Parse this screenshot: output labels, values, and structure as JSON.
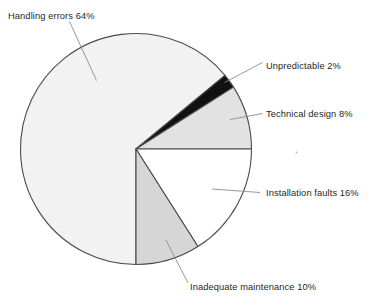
{
  "chart_data": {
    "type": "pie",
    "title": "",
    "subtitle": "",
    "xlabel": "",
    "ylabel": "",
    "legend_position": "none",
    "grid": false,
    "units": "percent",
    "total": 100,
    "categories": [
      "Handling errors",
      "Unpredictable",
      "Technical design",
      "Installation faults",
      "Inadequate maintenance"
    ],
    "values": [
      64,
      2,
      8,
      16,
      10
    ],
    "slices": [
      {
        "name": "handling-errors",
        "label": "Handling errors 64%",
        "category": "Handling errors",
        "value": 64,
        "color": "#f2f2f2",
        "start_angle_deg": 90,
        "end_angle_deg": 320.4
      },
      {
        "name": "unpredictable",
        "label": "Unpredictable 2%",
        "category": "Unpredictable",
        "value": 2,
        "color": "#111111",
        "start_angle_deg": 320.4,
        "end_angle_deg": 327.6
      },
      {
        "name": "technical-design",
        "label": "Technical design 8%",
        "category": "Technical design",
        "value": 8,
        "color": "#e2e2e2",
        "start_angle_deg": 327.6,
        "end_angle_deg": 360
      },
      {
        "name": "installation-faults",
        "label": "Installation faults 16%",
        "category": "Installation faults",
        "value": 16,
        "color": "#ffffff",
        "start_angle_deg": 0,
        "end_angle_deg": 57.6
      },
      {
        "name": "inadequate-maintenance",
        "label": "Inadequate maintenance 10%",
        "category": "Inadequate maintenance",
        "value": 10,
        "color": "#d6d6d6",
        "start_angle_deg": 57.6,
        "end_angle_deg": 90
      }
    ],
    "outline_color": "#4a4a4a",
    "leader_color": "#8c8c8c"
  },
  "labels": {
    "handling_errors": "Handling errors 64%",
    "unpredictable": "Unpredictable 2%",
    "technical_design": "Technical design 8%",
    "installation_faults": "Installation faults 16%",
    "inadequate_maintenance": "Inadequate maintenance 10%"
  }
}
